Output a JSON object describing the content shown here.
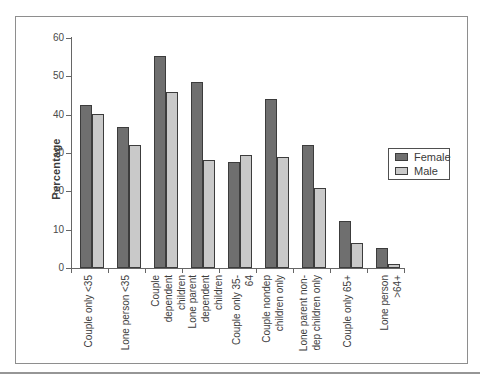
{
  "figure": {
    "ylabel": "Percentage"
  },
  "chart_data": {
    "type": "bar",
    "title": "",
    "xlabel": "",
    "ylabel": "Percentage",
    "ylim": [
      0,
      60
    ],
    "yticks": [
      0,
      10,
      20,
      30,
      40,
      50,
      60
    ],
    "grid": false,
    "legend_position": "middle-right",
    "categories": [
      "Couple only <35",
      "Lone person <35",
      "Couple dependent\nchildren",
      "Lone parent\ndependent children",
      "Couple only 35-64",
      "Couple nondep\nchildren only",
      "Lone parent non-\ndep children only",
      "Couple only 65+",
      "Lone person >64+"
    ],
    "series": [
      {
        "name": "Female",
        "color": "#6f6f6f",
        "values": [
          42.5,
          36.8,
          55.3,
          48.5,
          27.7,
          44.2,
          32.2,
          12.2,
          5.2
        ]
      },
      {
        "name": "Male",
        "color": "#c9c9c9",
        "values": [
          40.3,
          32,
          46,
          28.3,
          29.5,
          29,
          21,
          6.6,
          1
        ]
      }
    ]
  },
  "colors": {
    "bar_border": "#3c3c3c",
    "axis": "#666666",
    "text": "#3d3d3d",
    "frame_border": "#8e8e8e",
    "bottom_rule": "#969696"
  }
}
